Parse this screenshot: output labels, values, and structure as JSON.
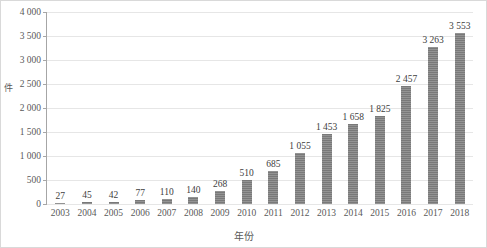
{
  "chart_data": {
    "type": "bar",
    "title": "",
    "xlabel": "年份",
    "ylabel": "件",
    "categories": [
      "2003",
      "2004",
      "2005",
      "2006",
      "2007",
      "2008",
      "2009",
      "2010",
      "2011",
      "2012",
      "2013",
      "2014",
      "2015",
      "2016",
      "2017",
      "2018"
    ],
    "values": [
      27,
      45,
      42,
      77,
      110,
      140,
      268,
      510,
      685,
      1055,
      1453,
      1658,
      1825,
      2457,
      3263,
      3553
    ],
    "value_labels": [
      "27",
      "45",
      "42",
      "77",
      "110",
      "140",
      "268",
      "510",
      "685",
      "1 055",
      "1 453",
      "1 658",
      "1 825",
      "2 457",
      "3 263",
      "3 553"
    ],
    "ylim": [
      0,
      4000
    ],
    "ytick_values": [
      0,
      500,
      1000,
      1500,
      2000,
      2500,
      3000,
      3500,
      4000
    ],
    "ytick_labels": [
      "0",
      "500",
      "1 000",
      "1 500",
      "2 000",
      "2 500",
      "3 000",
      "3 500",
      "4 000"
    ],
    "grid": true,
    "legend": false,
    "bar_color": "#7f7f7f",
    "grid_color": "#e6e6e6",
    "axis_color": "#a6a6a6",
    "text_color": "#595959"
  }
}
